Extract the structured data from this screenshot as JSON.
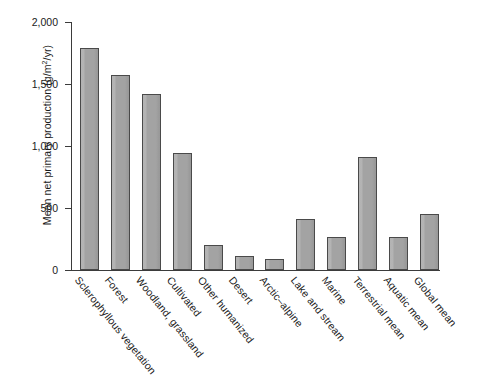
{
  "chart_data": {
    "type": "bar",
    "title": "",
    "xlabel": "",
    "ylabel": "Mean net primary production (g/m2/yr)",
    "ylim": [
      0,
      2000
    ],
    "ytick_labels": [
      "0",
      "500",
      "1,000",
      "1,500",
      "2,000"
    ],
    "yticks": [
      0,
      500,
      1000,
      1500,
      2000
    ],
    "grid": false,
    "legend": null,
    "bar_color": "#a3a3a3",
    "bar_edge_color": "#4a4a4a",
    "categories": [
      "Sclerophyllous vegetation",
      "Forest",
      "Woodland, grassland",
      "Cultivated",
      "Other humanized",
      "Desert",
      "Arctic–alpine",
      "Lake and stream",
      "Marine",
      "Terrestrial mean",
      "Aquatic mean",
      "Global mean"
    ],
    "values": [
      1790,
      1575,
      1420,
      945,
      205,
      110,
      85,
      410,
      265,
      910,
      270,
      455
    ]
  },
  "axis": {
    "y_title_main": "Mean net primary production (g/m",
    "y_title_sup": "2",
    "y_title_tail": "/yr)"
  }
}
